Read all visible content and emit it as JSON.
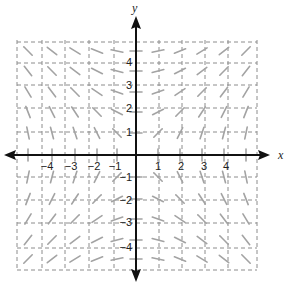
{
  "chart_data": {
    "type": "slope_field",
    "equation": "dy/dx = x/y",
    "xlabel": "x",
    "ylabel": "y",
    "x_ticks": [
      -4,
      -3,
      -2,
      -1,
      1,
      2,
      3,
      4
    ],
    "y_ticks": [
      4,
      3,
      2,
      1,
      -1,
      -2,
      -3,
      -4
    ],
    "x_tick_labels": [
      "−4",
      "−3",
      "−2",
      "−1",
      "1",
      "2",
      "3",
      "4"
    ],
    "y_tick_labels": [
      "4",
      "3",
      "2",
      "1",
      "−1",
      "−2",
      "−3",
      "−4"
    ],
    "xlim": [
      -5,
      5
    ],
    "ylim": [
      -5,
      5
    ],
    "grid": "dashed",
    "segment_lattice": {
      "x": [
        -5,
        -4,
        -3,
        -2,
        -1,
        0,
        1,
        2,
        3,
        4,
        5
      ],
      "y": [
        5,
        4,
        3,
        2,
        1,
        0,
        -1,
        -2,
        -3,
        -4,
        -5
      ]
    },
    "note": "Slopes negative in quadrants II and IV, positive in I and III; horizontal along y-axis, vertical along x-axis"
  },
  "layout": {
    "grid_v_px": [
      17,
      42,
      65,
      89,
      114,
      159,
      182,
      205,
      228,
      257
    ],
    "grid_h_px": [
      42,
      63,
      85,
      108,
      132,
      177,
      200,
      223,
      248,
      270
    ],
    "grid_box": {
      "left": 17,
      "right": 257,
      "top": 40,
      "bottom": 270
    },
    "origin": {
      "x": 136,
      "y": 155
    },
    "seg_cols_px": [
      28,
      52,
      75,
      97,
      117,
      136,
      158,
      180,
      202,
      224,
      246
    ],
    "seg_rows_px": [
      51,
      71,
      92,
      112,
      133,
      155,
      177,
      199,
      219,
      240,
      259
    ],
    "x_tick_px": [
      47,
      71,
      94,
      115,
      158,
      181,
      204,
      226
    ],
    "y_tick_px": [
      62,
      85,
      108,
      132,
      177,
      200,
      222,
      247
    ],
    "seg_len": 12,
    "colors": {
      "axis": "#111111",
      "grid": "#8c8c8c",
      "segment": "#a3a3a3"
    }
  }
}
